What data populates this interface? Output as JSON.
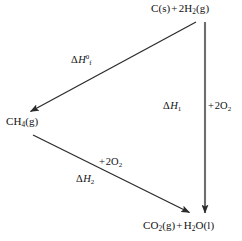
{
  "diagram": {
    "background_color": "#ffffff",
    "stroke_color": "#2b2b2b",
    "text_color": "#121212",
    "nodes": {
      "reactants": {
        "text": "C(s) + 2H2(g)",
        "parts": [
          {
            "t": "C(s)"
          },
          {
            "t": " + 2H"
          },
          {
            "t": "2",
            "style": "sub"
          },
          {
            "t": "(g)"
          }
        ]
      },
      "methane": {
        "text": "CH4(g)",
        "parts": [
          {
            "t": "CH"
          },
          {
            "t": "4",
            "style": "sub"
          },
          {
            "t": "(g)"
          }
        ]
      },
      "products": {
        "text": "CO2(g) + H2O(l)",
        "parts": [
          {
            "t": "CO"
          },
          {
            "t": "2",
            "style": "sub"
          },
          {
            "t": "(g) + H"
          },
          {
            "t": "2",
            "style": "sub"
          },
          {
            "t": "O(l)"
          }
        ]
      }
    },
    "arrows": {
      "formation": {
        "name": "formation-arrow",
        "label": "ΔH°f",
        "from": "reactants",
        "to": "methane",
        "x1": 196,
        "y1": 22,
        "x2": 29,
        "y2": 112
      },
      "combustion_direct": {
        "name": "direct-combustion-arrow",
        "label_left": "ΔH1",
        "label_right": "+ 2O2",
        "from": "reactants",
        "to": "products",
        "x1": 205,
        "y1": 22,
        "x2": 205,
        "y2": 214
      },
      "combustion_methane": {
        "name": "methane-combustion-arrow",
        "label_top": "+ 2O2",
        "label_bottom": "ΔH2",
        "from": "methane",
        "to": "products",
        "x1": 33,
        "y1": 135,
        "x2": 191,
        "y2": 213
      }
    }
  }
}
